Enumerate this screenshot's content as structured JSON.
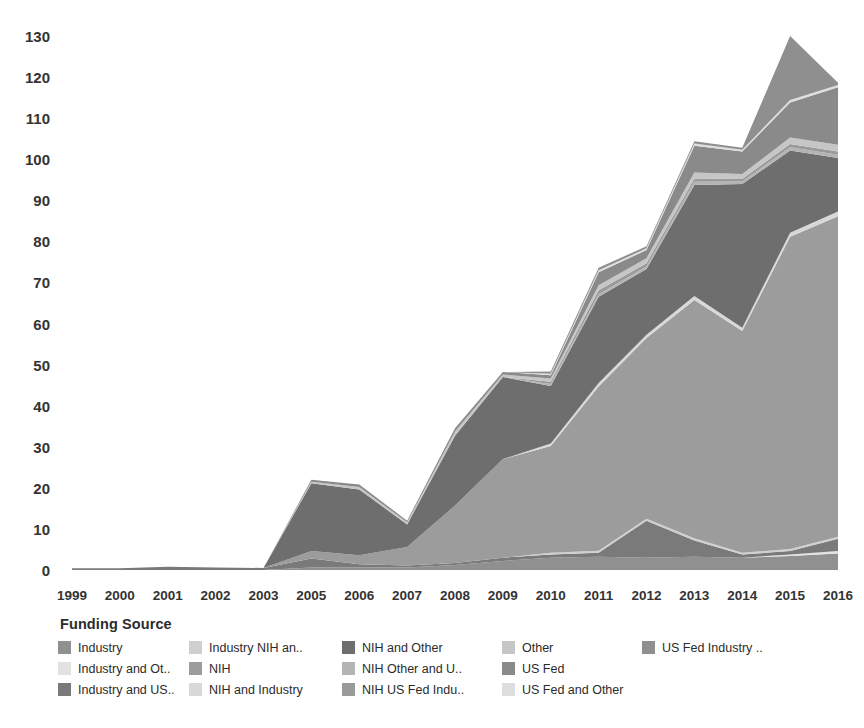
{
  "chart_data": {
    "type": "area",
    "stacked": true,
    "title": "",
    "xlabel": "",
    "ylabel": "",
    "ylim": [
      0,
      130
    ],
    "yticks": [
      0,
      10,
      20,
      30,
      40,
      50,
      60,
      70,
      80,
      90,
      100,
      110,
      120,
      130
    ],
    "grid": false,
    "legend_position": "bottom",
    "legend_title": "Funding Source",
    "categories": [
      "1999",
      "2000",
      "2001",
      "2002",
      "2003",
      "2005",
      "2006",
      "2007",
      "2008",
      "2009",
      "2010",
      "2011",
      "2012",
      "2013",
      "2014",
      "2015",
      "2016"
    ],
    "series": [
      {
        "name": "Industry",
        "color": "#909090",
        "values": [
          0,
          0,
          0,
          0,
          0,
          0.6,
          0.6,
          0.6,
          1.2,
          2.2,
          3.0,
          3.2,
          3.0,
          3.2,
          3.0,
          3.4,
          4.0
        ]
      },
      {
        "name": "Industry and Other",
        "color": "#e2e2e2",
        "values": [
          0,
          0,
          0,
          0,
          0,
          0,
          0,
          0,
          0,
          0,
          0,
          0,
          0,
          0,
          0,
          0.4,
          0.6
        ]
      },
      {
        "name": "Industry and US Fed",
        "color": "#7a7a7a",
        "values": [
          0.4,
          0.4,
          0.8,
          0.6,
          0.5,
          2.2,
          0.8,
          0.5,
          0.5,
          0.8,
          0.8,
          1.0,
          9.0,
          4.0,
          0.8,
          0.8,
          3.0
        ]
      },
      {
        "name": "Industry NIH and Other",
        "color": "#cfcfcf",
        "values": [
          0,
          0,
          0,
          0,
          0,
          0,
          0,
          0,
          0,
          0,
          0.4,
          0.5,
          0.5,
          0.5,
          0.4,
          0.5,
          0.5
        ]
      },
      {
        "name": "NIH",
        "color": "#9c9c9c",
        "values": [
          0,
          0,
          0,
          0,
          0,
          1.8,
          2.2,
          4.5,
          14.0,
          24.0,
          26.0,
          40.0,
          44.0,
          58.0,
          54.0,
          76.0,
          78.0
        ]
      },
      {
        "name": "NIH and Industry",
        "color": "#d8d8d8",
        "values": [
          0,
          0,
          0,
          0,
          0,
          0,
          0,
          0,
          0,
          0,
          0.6,
          0.8,
          0.8,
          1.0,
          0.8,
          1.0,
          1.2
        ]
      },
      {
        "name": "NIH and Other",
        "color": "#6e6e6e",
        "values": [
          0,
          0,
          0,
          0,
          0,
          16.5,
          16.0,
          5.5,
          17.0,
          20.0,
          14.0,
          21.0,
          16.0,
          27.0,
          35.0,
          20.0,
          13.0
        ]
      },
      {
        "name": "NIH Other and US Fed",
        "color": "#b4b4b4",
        "values": [
          0,
          0,
          0,
          0,
          0,
          0,
          0,
          0,
          0,
          0,
          0.5,
          0.6,
          0.6,
          0.8,
          0.6,
          0.8,
          0.8
        ]
      },
      {
        "name": "NIH US Fed Industry",
        "color": "#9a9a9a",
        "values": [
          0,
          0,
          0,
          0,
          0,
          0,
          0,
          0,
          0,
          0,
          0.5,
          1.0,
          0.8,
          0.8,
          0.6,
          0.8,
          0.8
        ]
      },
      {
        "name": "Other",
        "color": "#c6c6c6",
        "values": [
          0,
          0,
          0,
          0,
          0,
          0.4,
          0.6,
          0.5,
          1.0,
          0.6,
          0.8,
          1.2,
          1.2,
          1.5,
          1.2,
          1.6,
          1.6
        ]
      },
      {
        "name": "US Fed",
        "color": "#8a8a8a",
        "values": [
          0,
          0,
          0,
          0,
          0,
          0.5,
          0.6,
          0.4,
          0.8,
          0.6,
          0.8,
          3.2,
          2.0,
          6.5,
          5.5,
          8.5,
          14.0
        ]
      },
      {
        "name": "US Fed and Other",
        "color": "#dedede",
        "values": [
          0,
          0,
          0,
          0,
          0,
          0,
          0,
          0,
          0,
          0,
          0.4,
          0.5,
          0.4,
          0.5,
          0.4,
          0.6,
          0.6
        ]
      },
      {
        "name": "US Fed Industry",
        "color": "#8f8f8f",
        "values": [
          0,
          0,
          0,
          0,
          0,
          0,
          0,
          0,
          0,
          0,
          0.5,
          0.6,
          0.5,
          0.6,
          0.5,
          15.6,
          0.5
        ]
      }
    ]
  },
  "legend": {
    "title": "Funding Source",
    "columns": [
      [
        {
          "label": "Industry",
          "color": "#909090"
        },
        {
          "label": "Industry and Ot..",
          "color": "#e2e2e2"
        },
        {
          "label": "Industry and US..",
          "color": "#7a7a7a"
        }
      ],
      [
        {
          "label": "Industry NIH an..",
          "color": "#cfcfcf"
        },
        {
          "label": "NIH",
          "color": "#9c9c9c"
        },
        {
          "label": "NIH and Industry",
          "color": "#d8d8d8"
        }
      ],
      [
        {
          "label": "NIH and Other",
          "color": "#6e6e6e"
        },
        {
          "label": "NIH Other and U..",
          "color": "#b4b4b4"
        },
        {
          "label": "NIH US Fed Indu..",
          "color": "#9a9a9a"
        }
      ],
      [
        {
          "label": "Other",
          "color": "#c6c6c6"
        },
        {
          "label": "US Fed",
          "color": "#8a8a8a"
        },
        {
          "label": "US Fed and Other",
          "color": "#dedede"
        }
      ],
      [
        {
          "label": "US Fed Industry ..",
          "color": "#8f8f8f"
        }
      ]
    ]
  },
  "axes": {
    "y_ticks": [
      "130",
      "120",
      "110",
      "100",
      "90",
      "80",
      "70",
      "60",
      "50",
      "40",
      "30",
      "20",
      "10",
      "0"
    ],
    "x_ticks": [
      "1999",
      "2000",
      "2001",
      "2002",
      "2003",
      "2005",
      "2006",
      "2007",
      "2008",
      "2009",
      "2010",
      "2011",
      "2012",
      "2013",
      "2014",
      "2015",
      "2016"
    ]
  }
}
